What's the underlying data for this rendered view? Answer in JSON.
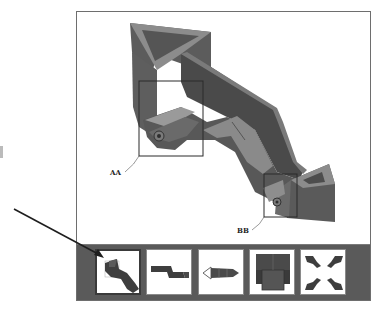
{
  "viewer": {
    "detail_labels": [
      {
        "id": "AA",
        "text": "AA"
      },
      {
        "id": "BB",
        "text": "BB"
      }
    ],
    "thumbnails": [
      {
        "name": "isometric-view",
        "selected": true
      },
      {
        "name": "side-view",
        "selected": false
      },
      {
        "name": "end-view",
        "selected": false
      },
      {
        "name": "front-view",
        "selected": false
      },
      {
        "name": "exploded-view",
        "selected": false
      }
    ]
  },
  "annotation": {
    "arrow_points_to": "isometric-view"
  },
  "colors": {
    "part_dark": "#4a4a4a",
    "part_mid": "#6b6b6b",
    "part_light": "#8e8e8e",
    "strip_bg": "#5a5a5a",
    "frame_border": "#6e6e6e"
  }
}
